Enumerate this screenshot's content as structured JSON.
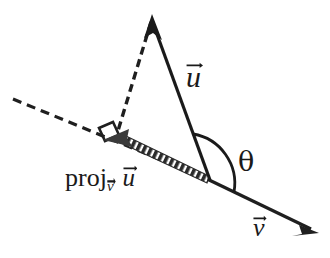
{
  "figure": {
    "kind": "vector-projection-diagram",
    "background_color": "#ffffff",
    "ink_color": "#1a1a1a",
    "labels": {
      "u_vector": "u",
      "v_vector": "v",
      "angle": "θ",
      "projection_prefix": "proj",
      "projection_subscript": "v",
      "projection_argument": "u"
    },
    "elements": {
      "v_line": "solid-line-with-right-arrowhead",
      "v_line_extension": "dashed-line-to-upper-left",
      "u_arrow": "solid-arrow-from-origin-to-apex",
      "perpendicular": "dashed-segment-from-apex-to-foot",
      "projection_arrow": "thick-hatched-arrow-along-v-toward-upper-left",
      "right_angle_marker": "small-square-at-foot-of-perpendicular",
      "angle_arc": "arc-between-u-and-v-at-origin"
    },
    "points": {
      "origin": [
        210,
        180
      ],
      "apex": [
        152,
        18
      ],
      "foot": [
        116,
        133
      ],
      "projection_tip": [
        104,
        140
      ],
      "v_arrow_tip": [
        318,
        233
      ],
      "v_extension_end": [
        13,
        99
      ]
    }
  }
}
